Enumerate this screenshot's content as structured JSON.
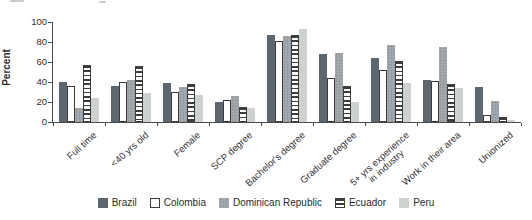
{
  "chart_data": {
    "type": "bar",
    "title": "",
    "xlabel": "",
    "ylabel": "Percent",
    "ylim": [
      0,
      100
    ],
    "y_tick_step": 20,
    "grid": false,
    "legend_position": "bottom",
    "categories": [
      "Full time",
      "<40 yrs old",
      "Female",
      "SCP degree",
      "Bachelor's degree",
      "Graduate degree",
      "5+ yrs experience\nin industry",
      "Work in their area",
      "Unionized"
    ],
    "series": [
      {
        "name": "Brazil",
        "pattern": "solid",
        "color": "#5d6770",
        "values": [
          40,
          36,
          39,
          20,
          87,
          68,
          64,
          42,
          35
        ]
      },
      {
        "name": "Colombia",
        "pattern": "outline",
        "color": "#ffffff",
        "values": [
          36,
          40,
          30,
          22,
          81,
          44,
          52,
          41,
          7
        ]
      },
      {
        "name": "Dominican Republic",
        "pattern": "dots",
        "color": "#a0a6a9",
        "values": [
          14,
          42,
          35,
          26,
          86,
          69,
          77,
          75,
          21
        ]
      },
      {
        "name": "Ecuador",
        "pattern": "hstripes",
        "color": "#ffffff",
        "values": [
          57,
          56,
          38,
          15,
          87,
          36,
          61,
          38,
          5
        ]
      },
      {
        "name": "Peru",
        "pattern": "solid",
        "color": "#cdd1d0",
        "values": [
          24,
          29,
          27,
          14,
          93,
          20,
          39,
          34,
          2
        ]
      }
    ],
    "outline_color": "#3c3c3c"
  }
}
